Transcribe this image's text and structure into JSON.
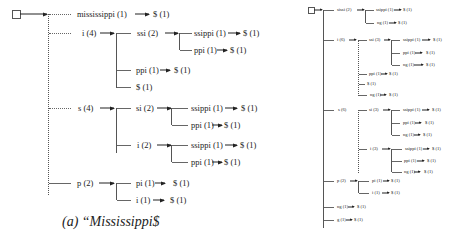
{
  "left_tree": {
    "caption": "(a) “Mississippi$",
    "nodes": {
      "mississippi": "mississippi  (1)",
      "mississippi_end": "$ (1)",
      "i": "i (4)",
      "ssi": "ssi (2)",
      "ssi_ssippi": "ssippi (1)",
      "ssi_ssippi_end": "$ (1)",
      "ssi_ppi": "ppi (1)",
      "ssi_ppi_end": "$ (1)",
      "i_ppi": "ppi (1)",
      "i_ppi_end": "$ (1)",
      "i_end": "$ (1)",
      "s": "s (4)",
      "si": "si (2)",
      "si_ssippi": "ssippi (1)",
      "si_ssippi_end": "$ (1)",
      "si_ppi": "ppi (1)",
      "si_ppi_end": "$ (1)",
      "s_i": "i (2)",
      "s_i_ssippi": "ssippi (1)",
      "s_i_ssippi_end": "$ (1)",
      "s_i_ppi": "ppi (1)",
      "s_i_ppi_end": "$ (1)",
      "p": "p (2)",
      "pi": "pi (1)",
      "pi_end": "$ (1)",
      "p_i": "i (1)",
      "p_i_end": "$ (1)"
    }
  },
  "right_tree": {
    "nodes": {
      "top": "sissi (2)",
      "top_ssippi": "ssippi (1)",
      "top_ssippi_end": "$ (1)",
      "top_ng": "ng (1)",
      "top_ng_end": "$ (1)",
      "i": "i (6)",
      "ssi": "ssi (3)",
      "ssi_ssippi": "ssippi (1)",
      "ssi_ssippi_end": "$ (1)",
      "ssi_ppi": "ppi (1)",
      "ssi_ppi_end": "$ (1)",
      "ssi_ng": "ng (1)",
      "ssi_ng_end": "$ (1)",
      "i_ppi": "ppi (1)",
      "i_ppi_end": "$ (1)",
      "i_end": "$ (1)",
      "i_ng": "ng (1)",
      "i_ng_end": "$ (1)",
      "s": "s (6)",
      "si": "si (3)",
      "si_ssippi": "ssippi (1)",
      "si_ssippi_end": "$ (1)",
      "si_ppi": "ppi (1)",
      "si_ppi_end": "$ (1)",
      "si_ng": "ng (1)",
      "si_ng_end": "$ (1)",
      "s_i": "i (3)",
      "s_i_ssippi": "ssippi (1)",
      "s_i_ssippi_end": "$ (1)",
      "s_i_ppi": "ppi (1)",
      "s_i_ppi_end": "$ (1)",
      "s_i_ng": "ng (1)",
      "s_i_ng_end": "$ (1)",
      "p": "p (2)",
      "pi": "pi (1)",
      "pi_end": "$ (1)",
      "p_i": "i (1)",
      "p_i_end": "$ (1)",
      "ng": "ng (1)",
      "ng_end": "$ (1)",
      "g": "g (1)",
      "g_end": "$ (1)"
    }
  }
}
